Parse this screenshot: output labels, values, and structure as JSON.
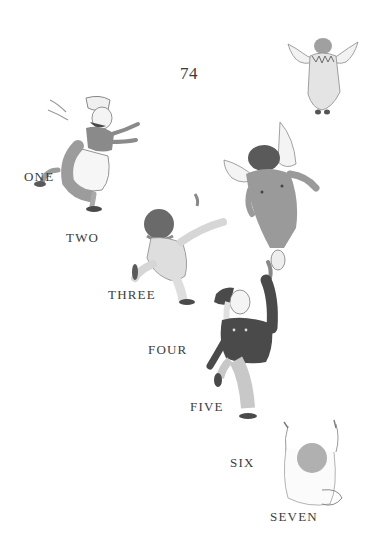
{
  "page": {
    "number": "74"
  },
  "counting_labels": [
    {
      "text": "ONE"
    },
    {
      "text": "TWO"
    },
    {
      "text": "THREE"
    },
    {
      "text": "FOUR"
    },
    {
      "text": "FIVE"
    },
    {
      "text": "SIX"
    },
    {
      "text": "SEVEN"
    }
  ],
  "figures": [
    {
      "name": "winged-child-in-gown",
      "description": "angel child with wings, flying away top-right"
    },
    {
      "name": "girl-with-bonnet-and-apron",
      "description": "girl running with arms outstretched"
    },
    {
      "name": "winged-child-in-overalls",
      "description": "child with wings, back view, flying"
    },
    {
      "name": "curly-haired-child-reaching",
      "description": "child in pale suit reaching up-right"
    },
    {
      "name": "boy-in-cap-and-jacket",
      "description": "boy in dark jacket reaching upward"
    },
    {
      "name": "baby-arms-raised",
      "description": "bald baby seen from behind, arms raised"
    }
  ],
  "colors": {
    "ink": "#3c3c3c",
    "paper": "#ffffff",
    "wash_light": "#c8c8c8",
    "wash_mid": "#9a9a9a",
    "wash_dark": "#5a5a5a"
  }
}
